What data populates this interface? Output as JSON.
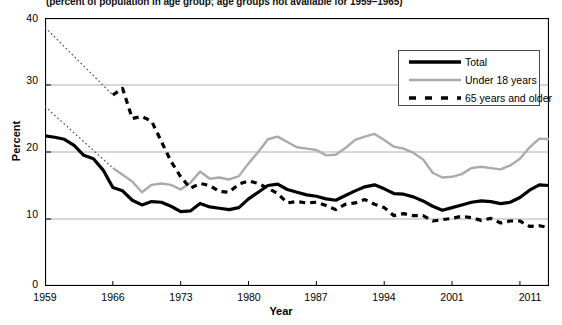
{
  "chart_data": {
    "type": "line",
    "title": "",
    "subtitle": "(percent of population in age group; age groups not available for 1959–1965)",
    "xlabel": "Year",
    "ylabel": "Percent",
    "xlim": [
      1959,
      2011
    ],
    "ylim": [
      0,
      40
    ],
    "yticks": [
      0,
      10,
      20,
      30,
      40
    ],
    "xticks": [
      1959,
      1966,
      1973,
      1980,
      1987,
      1994,
      2001,
      2008,
      2011
    ],
    "xtick_labels": [
      "1959",
      "1966",
      "1973",
      "1980",
      "1987",
      "1994",
      "2001",
      "",
      "2011"
    ],
    "grid": "horizontal",
    "legend_position": "upper-right",
    "series": [
      {
        "name": "Total",
        "style": "solid",
        "color": "#000000",
        "x": [
          1959,
          1960,
          1961,
          1962,
          1963,
          1964,
          1965,
          1966,
          1967,
          1968,
          1969,
          1970,
          1971,
          1972,
          1973,
          1974,
          1975,
          1976,
          1977,
          1978,
          1979,
          1980,
          1981,
          1982,
          1983,
          1984,
          1985,
          1986,
          1987,
          1988,
          1989,
          1990,
          1991,
          1992,
          1993,
          1994,
          1995,
          1996,
          1997,
          1998,
          1999,
          2000,
          2001,
          2002,
          2003,
          2004,
          2005,
          2006,
          2007,
          2008,
          2009,
          2010,
          2011
        ],
        "values": [
          22.4,
          22.2,
          21.9,
          21.0,
          19.5,
          19.0,
          17.3,
          14.7,
          14.2,
          12.8,
          12.1,
          12.6,
          12.5,
          11.9,
          11.1,
          11.2,
          12.3,
          11.8,
          11.6,
          11.4,
          11.7,
          13.0,
          14.0,
          15.0,
          15.2,
          14.4,
          14.0,
          13.6,
          13.4,
          13.0,
          12.8,
          13.5,
          14.2,
          14.8,
          15.1,
          14.5,
          13.8,
          13.7,
          13.3,
          12.7,
          11.9,
          11.3,
          11.7,
          12.1,
          12.5,
          12.7,
          12.6,
          12.3,
          12.5,
          13.2,
          14.3,
          15.1,
          15.0
        ]
      },
      {
        "name": "Under 18 years",
        "style": "solid",
        "color": "#aaaaaa",
        "x": [
          1966,
          1967,
          1968,
          1969,
          1970,
          1971,
          1972,
          1973,
          1974,
          1975,
          1976,
          1977,
          1978,
          1979,
          1980,
          1981,
          1982,
          1983,
          1984,
          1985,
          1986,
          1987,
          1988,
          1989,
          1990,
          1991,
          1992,
          1993,
          1994,
          1995,
          1996,
          1997,
          1998,
          1999,
          2000,
          2001,
          2002,
          2003,
          2004,
          2005,
          2006,
          2007,
          2008,
          2009,
          2010,
          2011
        ],
        "values": [
          17.6,
          16.6,
          15.6,
          14.0,
          15.1,
          15.3,
          15.1,
          14.4,
          15.4,
          17.1,
          16.0,
          16.2,
          15.9,
          16.4,
          18.3,
          20.0,
          21.9,
          22.3,
          21.5,
          20.7,
          20.5,
          20.3,
          19.5,
          19.6,
          20.6,
          21.8,
          22.3,
          22.7,
          21.8,
          20.8,
          20.5,
          19.9,
          18.9,
          16.9,
          16.2,
          16.3,
          16.7,
          17.6,
          17.8,
          17.6,
          17.4,
          18.0,
          19.0,
          20.7,
          22.0,
          21.9
        ]
      },
      {
        "name": "65 years and older",
        "style": "dashed",
        "color": "#000000",
        "x": [
          1966,
          1967,
          1968,
          1969,
          1970,
          1971,
          1972,
          1973,
          1974,
          1975,
          1976,
          1977,
          1978,
          1979,
          1980,
          1981,
          1982,
          1983,
          1984,
          1985,
          1986,
          1987,
          1988,
          1989,
          1990,
          1991,
          1992,
          1993,
          1994,
          1995,
          1996,
          1997,
          1998,
          1999,
          2000,
          2001,
          2002,
          2003,
          2004,
          2005,
          2006,
          2007,
          2008,
          2009,
          2010,
          2011
        ],
        "values": [
          28.5,
          29.5,
          25.0,
          25.3,
          24.6,
          21.6,
          18.6,
          16.3,
          14.6,
          15.3,
          15.0,
          14.1,
          14.0,
          15.2,
          15.7,
          15.3,
          14.6,
          13.8,
          12.4,
          12.6,
          12.4,
          12.5,
          12.0,
          11.4,
          12.2,
          12.4,
          12.9,
          12.2,
          11.7,
          10.5,
          10.8,
          10.5,
          10.5,
          9.7,
          9.9,
          10.1,
          10.4,
          10.2,
          9.8,
          10.1,
          9.4,
          9.7,
          9.7,
          8.9,
          9.0,
          8.7
        ]
      }
    ],
    "extrapolation_segments": [
      {
        "name": "under-18-dotted-extension",
        "style": "dotted",
        "color": "#555555",
        "from": {
          "x": 1959,
          "y": 26.8
        },
        "to": {
          "x": 1966,
          "y": 17.6
        }
      },
      {
        "name": "65-and-older-dotted-extension",
        "style": "dotted",
        "color": "#555555",
        "from": {
          "x": 1959,
          "y": 38.6
        },
        "to": {
          "x": 1966,
          "y": 28.5
        }
      }
    ]
  },
  "legend": {
    "items": [
      {
        "label": "Total"
      },
      {
        "label": "Under 18 years"
      },
      {
        "label": "65 years and older"
      }
    ]
  },
  "axis": {
    "ylabel": "Percent",
    "xlabel": "Year",
    "ytick_labels": [
      "0",
      "10",
      "20",
      "30",
      "40"
    ],
    "xtick_labels": [
      "1959",
      "1966",
      "1973",
      "1980",
      "1987",
      "1994",
      "2001",
      "2011"
    ]
  },
  "subtitle": "(percent of population in age group; age groups not available for 1959–1965)"
}
